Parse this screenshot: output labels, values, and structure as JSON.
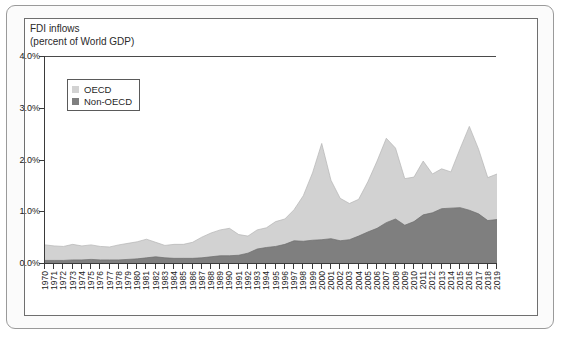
{
  "chart_data": {
    "type": "area",
    "stacked": true,
    "title": "FDI inflows\n(percent of World GDP)",
    "title_line1": "FDI inflows",
    "title_line2": "(percent of World GDP)",
    "xlabel": "",
    "ylabel": "",
    "ylim": [
      0,
      4.0
    ],
    "yticks": [
      0.0,
      1.0,
      2.0,
      3.0,
      4.0
    ],
    "ytick_labels": [
      "0.0%",
      "1.0%",
      "2.0%",
      "3.0%",
      "4.0%"
    ],
    "grid": false,
    "legend_position": "top-left",
    "colors": {
      "oecd": "#d2d2d2",
      "non_oecd": "#7f7f7f",
      "axis": "#3a3a3a",
      "frame": "#6f6f6f",
      "outer_frame": "#9a9a9a",
      "text": "#222222",
      "background": "#ffffff",
      "card_background": "#fbfbfb"
    },
    "categories": [
      "1970",
      "1971",
      "1972",
      "1973",
      "1974",
      "1975",
      "1976",
      "1977",
      "1978",
      "1979",
      "1980",
      "1981",
      "1982",
      "1983",
      "1984",
      "1985",
      "1986",
      "1987",
      "1988",
      "1989",
      "1990",
      "1991",
      "1992",
      "1993",
      "1994",
      "1995",
      "1996",
      "1997",
      "1998",
      "1999",
      "2000",
      "2001",
      "2002",
      "2003",
      "2004",
      "2005",
      "2006",
      "2007",
      "2008",
      "2009",
      "2010",
      "2011",
      "2012",
      "2013",
      "2014",
      "2015",
      "2016",
      "2017",
      "2018",
      "2019"
    ],
    "series": [
      {
        "name": "Non-OECD",
        "color": "#7f7f7f",
        "values": [
          0.05,
          0.05,
          0.05,
          0.06,
          0.06,
          0.07,
          0.06,
          0.06,
          0.06,
          0.07,
          0.08,
          0.1,
          0.12,
          0.1,
          0.09,
          0.09,
          0.09,
          0.1,
          0.12,
          0.14,
          0.14,
          0.15,
          0.19,
          0.27,
          0.3,
          0.32,
          0.36,
          0.43,
          0.42,
          0.44,
          0.45,
          0.47,
          0.43,
          0.45,
          0.52,
          0.6,
          0.67,
          0.78,
          0.85,
          0.73,
          0.8,
          0.93,
          0.97,
          1.05,
          1.06,
          1.07,
          1.02,
          0.95,
          0.82,
          0.84
        ]
      },
      {
        "name": "OECD",
        "color": "#d2d2d2",
        "values": [
          0.3,
          0.28,
          0.27,
          0.3,
          0.27,
          0.28,
          0.26,
          0.25,
          0.29,
          0.31,
          0.33,
          0.36,
          0.28,
          0.24,
          0.27,
          0.27,
          0.31,
          0.4,
          0.46,
          0.5,
          0.53,
          0.4,
          0.33,
          0.37,
          0.38,
          0.48,
          0.49,
          0.6,
          0.88,
          1.3,
          1.86,
          1.13,
          0.82,
          0.7,
          0.71,
          0.97,
          1.3,
          1.63,
          1.37,
          0.9,
          0.86,
          1.04,
          0.75,
          0.77,
          0.7,
          1.14,
          1.62,
          1.25,
          0.83,
          0.88
        ]
      }
    ],
    "totals": [
      0.35,
      0.33,
      0.32,
      0.36,
      0.33,
      0.35,
      0.32,
      0.31,
      0.35,
      0.38,
      0.41,
      0.46,
      0.4,
      0.34,
      0.36,
      0.36,
      0.4,
      0.5,
      0.58,
      0.64,
      0.67,
      0.55,
      0.52,
      0.64,
      0.68,
      0.8,
      0.85,
      1.03,
      1.3,
      1.74,
      2.31,
      1.6,
      1.25,
      1.15,
      1.23,
      1.57,
      1.97,
      2.41,
      2.22,
      1.63,
      1.66,
      1.97,
      1.72,
      1.82,
      1.76,
      2.21,
      2.64,
      2.2,
      1.65,
      1.72
    ],
    "annotations": {
      "peak_2000": "4.0%",
      "peak_2007": "3.25%",
      "peak_2016": "2.65%"
    }
  },
  "legend": {
    "items": [
      {
        "label": "OECD",
        "color": "#d2d2d2"
      },
      {
        "label": "Non-OECD",
        "color": "#7f7f7f"
      }
    ]
  }
}
